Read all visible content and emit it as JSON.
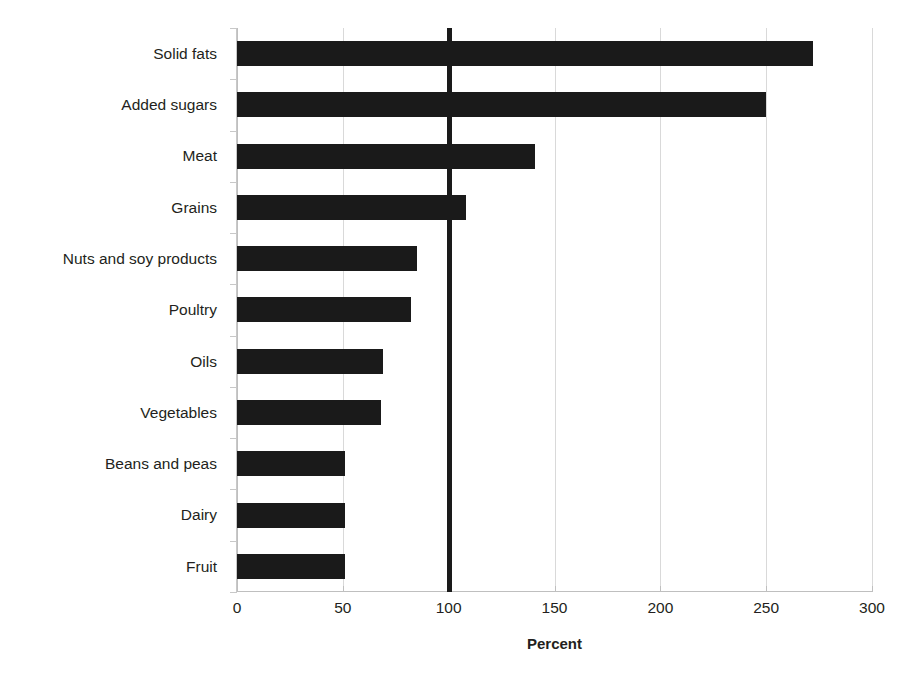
{
  "chart_data": {
    "type": "bar",
    "orientation": "horizontal",
    "title": "",
    "xlabel": "Percent",
    "ylabel": "",
    "xlim": [
      0,
      300
    ],
    "ylim": null,
    "xticks": [
      0,
      50,
      100,
      150,
      200,
      250,
      300
    ],
    "xtick_labels": [
      "0",
      "50",
      "100",
      "150",
      "200",
      "250",
      "300"
    ],
    "grid": "vertical-light",
    "legend": "none",
    "bar_color": "#1a1a1a",
    "reference_line": {
      "value": 100,
      "label": "",
      "color": "#1a1a1a",
      "style": "thick-solid"
    },
    "categories": [
      "Solid fats",
      "Added sugars",
      "Meat",
      "Grains",
      "Nuts and soy products",
      "Poultry",
      "Oils",
      "Vegetables",
      "Beans and peas",
      "Dairy",
      "Fruit"
    ],
    "values": [
      272,
      250,
      141,
      108,
      85,
      82,
      69,
      68,
      51,
      51,
      51
    ],
    "units": "percent"
  }
}
